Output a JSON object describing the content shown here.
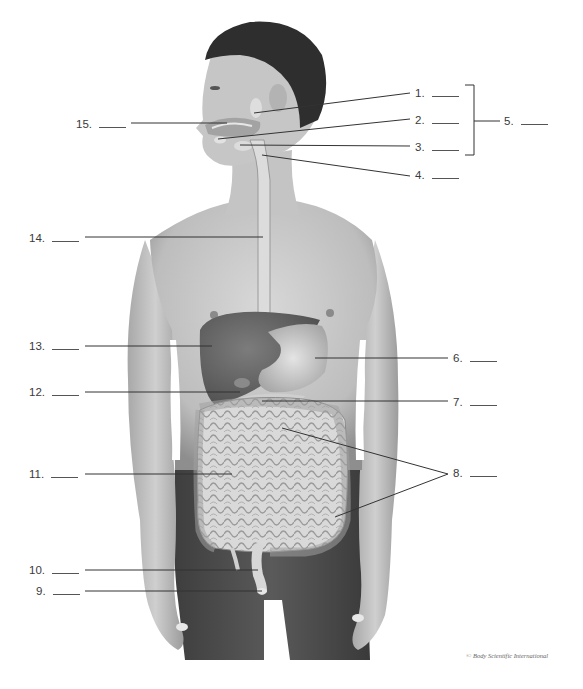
{
  "diagram": {
    "labels": [
      {
        "id": 1,
        "text": "1.",
        "blank": "____",
        "target": "parotid salivary gland"
      },
      {
        "id": 2,
        "text": "2.",
        "blank": "____",
        "target": "sublingual salivary gland"
      },
      {
        "id": 3,
        "text": "3.",
        "blank": "____",
        "target": "submandibular salivary gland"
      },
      {
        "id": 4,
        "text": "4.",
        "blank": "____",
        "target": "pharynx"
      },
      {
        "id": 5,
        "text": "5.",
        "blank": "____",
        "target": "salivary glands (bracket for 1-3)"
      },
      {
        "id": 6,
        "text": "6.",
        "blank": "____",
        "target": "stomach"
      },
      {
        "id": 7,
        "text": "7.",
        "blank": "____",
        "target": "pancreas"
      },
      {
        "id": 8,
        "text": "8.",
        "blank": "____",
        "target": "large intestine (two leader lines)"
      },
      {
        "id": 9,
        "text": "9.",
        "blank": "____",
        "target": "anus"
      },
      {
        "id": 10,
        "text": "10.",
        "blank": "____",
        "target": "rectum"
      },
      {
        "id": 11,
        "text": "11.",
        "blank": "____",
        "target": "small intestine"
      },
      {
        "id": 12,
        "text": "12.",
        "blank": "____",
        "target": "gallbladder"
      },
      {
        "id": 13,
        "text": "13.",
        "blank": "____",
        "target": "liver"
      },
      {
        "id": 14,
        "text": "14.",
        "blank": "____",
        "target": "esophagus"
      },
      {
        "id": 15,
        "text": "15.",
        "blank": "____",
        "target": "oral cavity"
      }
    ],
    "credit": "© Body Scientific International"
  },
  "colors": {
    "background": "#ffffff",
    "text": "#3a3a3a",
    "leader_line": "#333333",
    "skin": "#c9c9c9",
    "skin_shadow": "#9a9a9a",
    "hair": "#2e2e2e",
    "pants": "#4a4a4a",
    "organ_dark": "#6f6f6f",
    "organ_light": "#dedede"
  }
}
